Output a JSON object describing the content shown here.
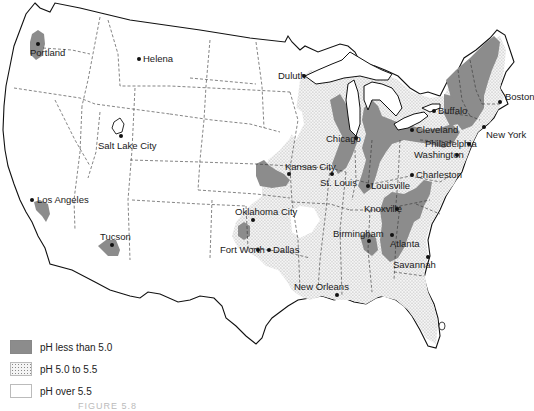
{
  "map": {
    "type": "choropleth",
    "region": "Contiguous United States",
    "colors": {
      "ph_less_than_5_0": "#8c8c8c",
      "ph_5_0_to_5_5": "dotted-stipple",
      "ph_over_5_5": "#ffffff",
      "outline": "#111111"
    },
    "cities": [
      {
        "name": "Portland",
        "x": 38,
        "y": 44
      },
      {
        "name": "Helena",
        "x": 139,
        "y": 59
      },
      {
        "name": "Salt Lake City",
        "x": 121,
        "y": 136
      },
      {
        "name": "Los Angeles",
        "x": 32,
        "y": 200
      },
      {
        "name": "Tucson",
        "x": 112,
        "y": 245
      },
      {
        "name": "Duluth",
        "x": 304,
        "y": 76
      },
      {
        "name": "Kansas City",
        "x": 289,
        "y": 174
      },
      {
        "name": "St. Louis",
        "x": 332,
        "y": 174
      },
      {
        "name": "Chicago",
        "x": 356,
        "y": 138
      },
      {
        "name": "Louisville",
        "x": 368,
        "y": 186
      },
      {
        "name": "Oklahoma City",
        "x": 253,
        "y": 220
      },
      {
        "name": "Fort Worth",
        "x": 258,
        "y": 250
      },
      {
        "name": "Dallas",
        "x": 269,
        "y": 250
      },
      {
        "name": "Birmingham",
        "x": 369,
        "y": 241
      },
      {
        "name": "Atlanta",
        "x": 392,
        "y": 235
      },
      {
        "name": "Knoxville",
        "x": 397,
        "y": 209
      },
      {
        "name": "Charleston",
        "x": 412,
        "y": 175
      },
      {
        "name": "Savannah",
        "x": 428,
        "y": 257
      },
      {
        "name": "New Orleans",
        "x": 337,
        "y": 295
      },
      {
        "name": "Buffalo",
        "x": 434,
        "y": 111
      },
      {
        "name": "Cleveland",
        "x": 412,
        "y": 130
      },
      {
        "name": "Philadelphia",
        "x": 469,
        "y": 144
      },
      {
        "name": "Washington",
        "x": 457,
        "y": 155
      },
      {
        "name": "New York",
        "x": 484,
        "y": 127
      },
      {
        "name": "Boston",
        "x": 500,
        "y": 102
      }
    ]
  },
  "labels": {
    "portland": "Portland",
    "helena": "Helena",
    "salt_lake_city": "Salt Lake City",
    "los_angeles": "Los Angeles",
    "tucson": "Tucson",
    "duluth": "Duluth",
    "kansas_city": "Kansas City",
    "st_louis": "St. Louis",
    "chicago": "Chicago",
    "louisville": "Louisville",
    "oklahoma_city": "Oklahoma City",
    "fort_worth": "Fort Worth",
    "dallas": "Dallas",
    "birmingham": "Birmingham",
    "atlanta": "Atlanta",
    "knoxville": "Knoxville",
    "charleston": "Charleston",
    "savannah": "Savannah",
    "new_orleans": "New Orleans",
    "buffalo": "Buffalo",
    "cleveland": "Cleveland",
    "philadelphia": "Philadelphia",
    "washington": "Washington",
    "new_york": "New York",
    "boston": "Boston"
  },
  "legend": {
    "items": [
      {
        "label": "pH less than 5.0",
        "swatch": "dark-gray"
      },
      {
        "label": "pH 5.0 to 5.5",
        "swatch": "stippled"
      },
      {
        "label": "pH over 5.5",
        "swatch": "white"
      }
    ]
  },
  "caption": "FIGURE 5.8"
}
